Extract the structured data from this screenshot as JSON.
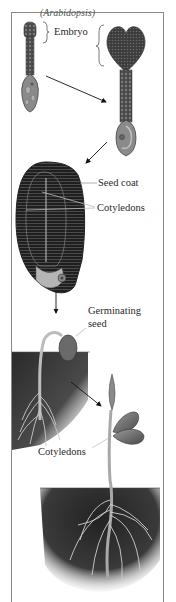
{
  "figure": {
    "top_caption": "(Arabidopsis)",
    "stages": [
      {
        "name": "early-embryo",
        "label": "Embryo"
      },
      {
        "name": "heart-stage-embryo"
      },
      {
        "name": "mature-seed",
        "labels": [
          "Seed coat",
          "Cotyledons"
        ]
      },
      {
        "name": "germinating-seed",
        "label": "Germinating seed"
      },
      {
        "name": "seedling",
        "label": "Cotyledons"
      }
    ],
    "labels": {
      "embryo": "Embryo",
      "seed_coat": "Seed coat",
      "cotyledons_seed": "Cotyledons",
      "germinating_line1": "Germinating",
      "germinating_line2": "seed",
      "cotyledons_seedling": "Cotyledons"
    },
    "colors": {
      "frame": "#8a8a8a",
      "embryo_dark": "#3a3a3a",
      "embryo_mid": "#6e6e6e",
      "suspensor": "#9a9a9a",
      "soil_dark": "#2b2b2b",
      "stem": "#b8b8b8",
      "leaf": "#7a7a7a",
      "text": "#2a2a2a",
      "background": "#ffffff"
    }
  }
}
